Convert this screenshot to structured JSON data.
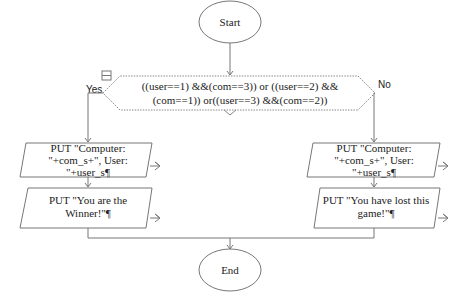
{
  "diagram": {
    "start": {
      "label": "Start"
    },
    "end": {
      "label": "End"
    },
    "decision": {
      "lines": [
        "((user==1) &&(com==3)) or ((user==2) &&",
        "(com==1)) or((user==3) &&(com==2))"
      ],
      "yes_label": "Yes",
      "no_label": "No"
    },
    "yes_branch": [
      {
        "lines": [
          "PUT \"Computer:",
          "\"+com_s+\", User:",
          "\"+user_s¶"
        ]
      },
      {
        "lines": [
          "PUT \"You are the",
          "Winner!\"¶"
        ]
      }
    ],
    "no_branch": [
      {
        "lines": [
          "PUT \"Computer:",
          "\"+com_s+\", User:",
          "\"+user_s¶"
        ]
      },
      {
        "lines": [
          "PUT \"You have lost this",
          "game!\"¶"
        ]
      }
    ],
    "colors": {
      "line": "#7a7a7a",
      "text": "#222222",
      "background": "#ffffff"
    }
  }
}
